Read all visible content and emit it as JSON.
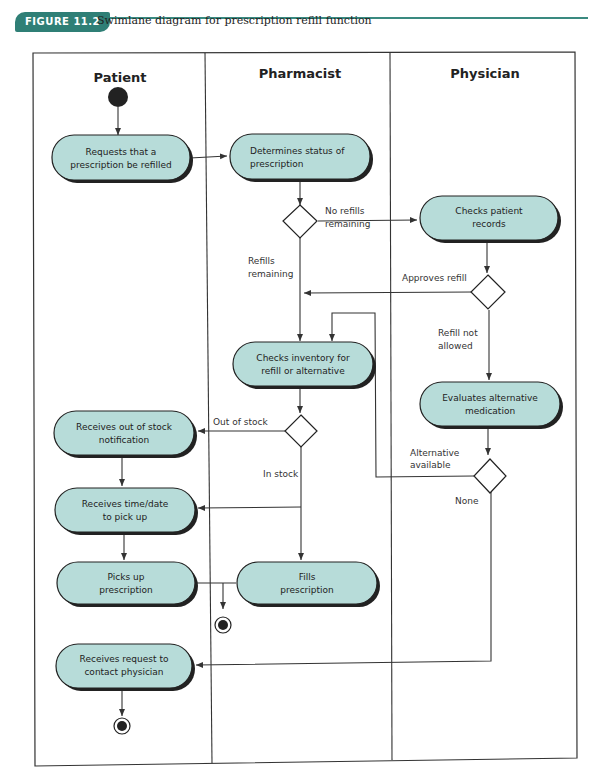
{
  "figure": {
    "label": "FIGURE 11.2",
    "caption": "Swimlane diagram for prescription refill function",
    "accent_color": "#2f7f76",
    "node_fill_color": "#b7dcd9"
  },
  "lanes": [
    {
      "id": "patient",
      "title": "Patient"
    },
    {
      "id": "pharmacist",
      "title": "Pharmacist"
    },
    {
      "id": "physician",
      "title": "Physician"
    }
  ],
  "nodes": {
    "request_refill": {
      "lane": "patient",
      "lines": [
        "Requests that a",
        "prescription be refilled"
      ]
    },
    "determine_status": {
      "lane": "pharmacist",
      "lines": [
        "Determines status of",
        "prescription"
      ]
    },
    "check_records": {
      "lane": "physician",
      "lines": [
        "Checks patient",
        "records"
      ]
    },
    "check_inventory": {
      "lane": "pharmacist",
      "lines": [
        "Checks inventory for",
        "refill or alternative"
      ]
    },
    "evaluate_alternative": {
      "lane": "physician",
      "lines": [
        "Evaluates alternative",
        "medication"
      ]
    },
    "out_of_stock": {
      "lane": "patient",
      "lines": [
        "Receives out of stock",
        "notification"
      ]
    },
    "receive_time": {
      "lane": "patient",
      "lines": [
        "Receives time/date",
        "to pick up"
      ]
    },
    "pick_up": {
      "lane": "patient",
      "lines": [
        "Picks up",
        "prescription"
      ]
    },
    "fill": {
      "lane": "pharmacist",
      "lines": [
        "Fills",
        "prescription"
      ]
    },
    "contact_physician": {
      "lane": "patient",
      "lines": [
        "Receives request to",
        "contact physician"
      ]
    }
  },
  "edge_labels": {
    "no_refills": [
      "No refills",
      "remaining"
    ],
    "refills_remaining": [
      "Refills",
      "remaining"
    ],
    "approves_refill": [
      "Approves refill"
    ],
    "refill_not_allowed": [
      "Refill not",
      "allowed"
    ],
    "out_of_stock": [
      "Out of stock"
    ],
    "in_stock": [
      "In stock"
    ],
    "alternative_available": [
      "Alternative",
      "available"
    ],
    "none": [
      "None"
    ]
  }
}
